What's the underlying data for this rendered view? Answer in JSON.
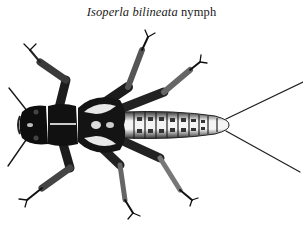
{
  "caption": {
    "scientific_name": "Isoperla bilineata",
    "stage": "nymph"
  },
  "illustration": {
    "subject": "stonefly nymph, dorsal view",
    "ink_color": "#111111",
    "paper_color": "#ffffff",
    "abdomen_segments": 10
  }
}
